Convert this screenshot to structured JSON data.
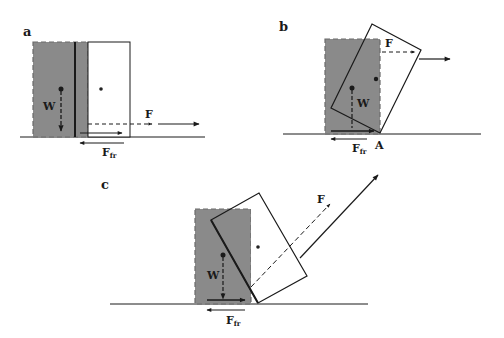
{
  "figure": {
    "background": "#ffffff",
    "colors": {
      "shaded_box": "#8a8a8a",
      "shaded_border": "#6a6a6a",
      "line": "#1a1a1a",
      "dot": "#222222"
    },
    "panels": [
      {
        "id": "a",
        "label": "a",
        "description": "Box pulled horizontally near the ground; slides without tipping",
        "force_labels": {
          "applied": "F",
          "weight": "W",
          "friction": "F",
          "friction_sub": "fr"
        }
      },
      {
        "id": "b",
        "label": "b",
        "description": "Box pulled horizontally high up; tips about corner A",
        "force_labels": {
          "applied": "F",
          "weight": "W",
          "friction": "F",
          "friction_sub": "fr",
          "pivot": "A"
        }
      },
      {
        "id": "c",
        "label": "c",
        "description": "Box pulled upward at an angle; tips about the bottom corner",
        "force_labels": {
          "applied": "F",
          "weight": "W",
          "friction": "F",
          "friction_sub": "fr"
        }
      }
    ]
  }
}
